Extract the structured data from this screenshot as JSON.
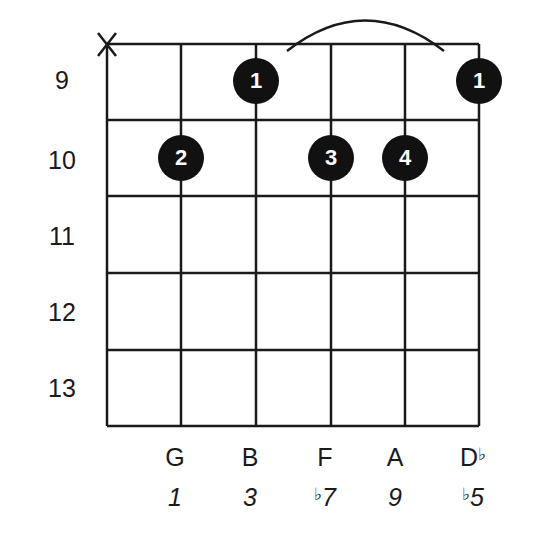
{
  "chord_diagram": {
    "start_fret": 9,
    "fret_numbers": [
      "9",
      "10",
      "11",
      "12",
      "13"
    ],
    "strings": 6,
    "muted_string_marker": "X",
    "muted_string": 1,
    "barre": {
      "from_string": 3,
      "to_string": 6,
      "fret": 9
    },
    "dots": [
      {
        "string": 3,
        "fret": 9,
        "finger": "1"
      },
      {
        "string": 6,
        "fret": 9,
        "finger": "1"
      },
      {
        "string": 2,
        "fret": 10,
        "finger": "2"
      },
      {
        "string": 4,
        "fret": 10,
        "finger": "3"
      },
      {
        "string": 5,
        "fret": 10,
        "finger": "4"
      }
    ],
    "notes": [
      {
        "letter": "G",
        "accidental": ""
      },
      {
        "letter": "B",
        "accidental": ""
      },
      {
        "letter": "F",
        "accidental": ""
      },
      {
        "letter": "A",
        "accidental": ""
      },
      {
        "letter": "D",
        "accidental": "♭"
      }
    ],
    "degrees": [
      {
        "accidental": "",
        "number": "1"
      },
      {
        "accidental": "",
        "number": "3"
      },
      {
        "accidental": "♭",
        "number": "7"
      },
      {
        "accidental": "",
        "number": "9"
      },
      {
        "accidental": "♭",
        "number": "5"
      }
    ]
  }
}
